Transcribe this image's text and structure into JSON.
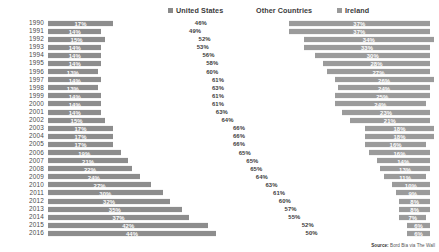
{
  "legend": {
    "items": [
      {
        "label": "United States",
        "key": "united-states",
        "color": "#8d8d8d"
      },
      {
        "label": "Other Countries",
        "key": "other-countries",
        "color": "#ffffff"
      },
      {
        "label": "Ireland",
        "key": "ireland",
        "color": "#9b9b9b"
      }
    ]
  },
  "source": {
    "prefix": "Source:",
    "text": "Bord Bia via The Wall"
  },
  "chart_data": {
    "type": "bar",
    "subtype": "stacked-horizontal-100",
    "title": "",
    "xlabel": "",
    "ylabel": "",
    "xlim": [
      0,
      100
    ],
    "grid": false,
    "legend_position": "top",
    "categories": [
      "1990",
      "1991",
      "1992",
      "1993",
      "1994",
      "1995",
      "1996",
      "1997",
      "1998",
      "1999",
      "2000",
      "2001",
      "2002",
      "2003",
      "2004",
      "2005",
      "2006",
      "2007",
      "2008",
      "2009",
      "2010",
      "2011",
      "2012",
      "2013",
      "2014",
      "2015",
      "2016"
    ],
    "series": [
      {
        "name": "United States",
        "color": "#8d8d8d",
        "values": [
          17,
          14,
          15,
          14,
          14,
          14,
          13,
          14,
          13,
          14,
          14,
          14,
          15,
          17,
          17,
          17,
          19,
          21,
          22,
          24,
          27,
          30,
          32,
          35,
          37,
          42,
          44
        ],
        "labels": [
          "17%",
          "14%",
          "15%",
          "14%",
          "14%",
          "14%",
          "13%",
          "14%",
          "13%",
          "14%",
          "14%",
          "14%",
          "15%",
          "17%",
          "17%",
          "17%",
          "19%",
          "21%",
          "22%",
          "24%",
          "27%",
          "30%",
          "32%",
          "35%",
          "37%",
          "42%",
          "44%"
        ]
      },
      {
        "name": "Other Countries",
        "color": "#ffffff",
        "values": [
          46,
          49,
          52,
          53,
          56,
          58,
          60,
          61,
          63,
          61,
          61,
          63,
          64,
          66,
          66,
          66,
          65,
          65,
          65,
          64,
          63,
          61,
          60,
          57,
          55,
          52,
          50
        ],
        "labels": [
          "46%",
          "49%",
          "52%",
          "53%",
          "56%",
          "58%",
          "60%",
          "61%",
          "63%",
          "61%",
          "61%",
          "63%",
          "64%",
          "66%",
          "66%",
          "66%",
          "65%",
          "65%",
          "65%",
          "64%",
          "63%",
          "61%",
          "60%",
          "57%",
          "55%",
          "52%",
          "50%"
        ]
      },
      {
        "name": "Ireland",
        "color": "#9b9b9b",
        "values": [
          37,
          37,
          34,
          33,
          30,
          28,
          27,
          26,
          24,
          25,
          24,
          23,
          21,
          18,
          18,
          16,
          16,
          14,
          13,
          11,
          10,
          9,
          8,
          8,
          7,
          6,
          6
        ],
        "labels": [
          "37%",
          "37%",
          "34%",
          "33%",
          "30%",
          "28%",
          "27%",
          "26%",
          "24%",
          "25%",
          "24%",
          "23%",
          "21%",
          "18%",
          "18%",
          "16%",
          "16%",
          "14%",
          "13%",
          "11%",
          "10%",
          "9%",
          "8%",
          "8%",
          "7%",
          "6%",
          "6%"
        ]
      }
    ]
  }
}
